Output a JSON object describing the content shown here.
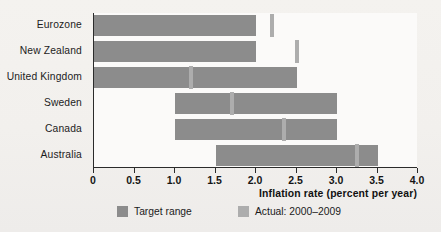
{
  "chart_data": {
    "type": "bar",
    "title": "",
    "subtitle": "",
    "xlabel": "Inflation rate (percent per year)",
    "ylabel": "",
    "orientation": "horizontal",
    "grid": false,
    "xlim": [
      0,
      4.0
    ],
    "xticks": [
      "0",
      "0.5",
      "1.0",
      "1.5",
      "2.0",
      "2.5",
      "3.0",
      "3.5",
      "4.0"
    ],
    "xtick_values": [
      0,
      0.5,
      1.0,
      1.5,
      2.0,
      2.5,
      3.0,
      3.5,
      4.0
    ],
    "categories": [
      "Eurozone",
      "New Zealand",
      "United Kingdom",
      "Sweden",
      "Canada",
      "Australia"
    ],
    "legend_position": "bottom",
    "series": [
      {
        "name": "Target range",
        "kind": "range",
        "color": "#8c8c8c",
        "values": [
          {
            "category": "Eurozone",
            "low": 0.0,
            "high": 2.0
          },
          {
            "category": "New Zealand",
            "low": 0.0,
            "high": 2.0
          },
          {
            "category": "United Kingdom",
            "low": 0.0,
            "high": 2.5
          },
          {
            "category": "Sweden",
            "low": 1.0,
            "high": 3.0
          },
          {
            "category": "Canada",
            "low": 1.0,
            "high": 3.0
          },
          {
            "category": "Australia",
            "low": 1.5,
            "high": 3.5
          }
        ]
      },
      {
        "name": "Actual: 2000–2009",
        "kind": "marker",
        "color": "#adadad",
        "values": [
          {
            "category": "Eurozone",
            "value": 2.2
          },
          {
            "category": "New Zealand",
            "value": 2.5
          },
          {
            "category": "United Kingdom",
            "value": 1.2
          },
          {
            "category": "Sweden",
            "value": 1.7
          },
          {
            "category": "Canada",
            "value": 2.35
          },
          {
            "category": "Australia",
            "value": 3.25
          }
        ]
      }
    ]
  },
  "axis": {
    "x_title": "Inflation rate (percent per year)"
  },
  "legend": {
    "items": [
      {
        "label": "Target range",
        "color": "#8c8c8c"
      },
      {
        "label": "Actual: 2000–2009",
        "color": "#adadad"
      }
    ]
  },
  "colors": {
    "target": "#8c8c8c",
    "actual": "#adadad",
    "axis": "#2b2b2b",
    "background": "#f3f1ee",
    "plot_background": "#fbfaf9"
  }
}
